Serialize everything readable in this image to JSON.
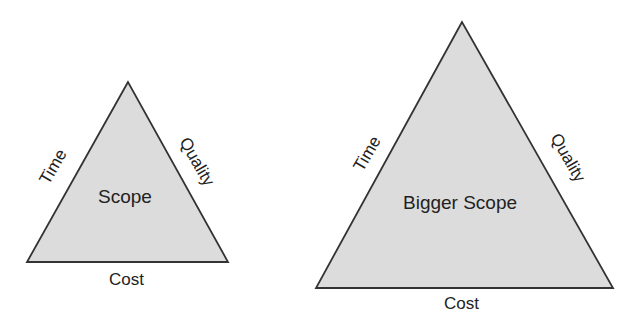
{
  "colors": {
    "fill": "#dcdcdc",
    "stroke": "#333333",
    "text": "#222222",
    "background": "#ffffff"
  },
  "diagrams": [
    {
      "name": "small-triangle",
      "center_label": "Scope",
      "left_edge_label": "Time",
      "right_edge_label": "Quality",
      "base_label": "Cost"
    },
    {
      "name": "large-triangle",
      "center_label": "Bigger Scope",
      "left_edge_label": "Time",
      "right_edge_label": "Quality",
      "base_label": "Cost"
    }
  ]
}
